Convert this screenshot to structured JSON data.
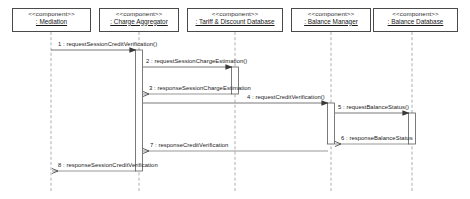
{
  "diagram": {
    "type": "uml-sequence-diagram",
    "width": 470,
    "height": 199,
    "background_color": "#ffffff",
    "line_color": "#5a5a5a",
    "text_color": "#1a1a1a"
  },
  "participants": [
    {
      "id": "mediation",
      "stereotype": "<<component>>",
      "name": ": Mediation",
      "box": {
        "x": 12,
        "y": 8,
        "w": 79,
        "h": 24
      },
      "lifeline_x": 51,
      "activation": null
    },
    {
      "id": "charge-aggregator",
      "stereotype": "<<component>>",
      "name": ": Charge Aggregator",
      "box": {
        "x": 99,
        "y": 8,
        "w": 80,
        "h": 24
      },
      "lifeline_x": 139,
      "activation": {
        "y": 50,
        "h": 121,
        "w": 7
      }
    },
    {
      "id": "tariff-discount-database",
      "stereotype": "<<component>>",
      "name": ": Tariff & Discount Database",
      "box": {
        "x": 187,
        "y": 8,
        "w": 96,
        "h": 24
      },
      "lifeline_x": 235,
      "activation": {
        "y": 67,
        "h": 27,
        "w": 7
      }
    },
    {
      "id": "balance-manager",
      "stereotype": "<<component>>",
      "name": ": Balance Manager",
      "box": {
        "x": 291,
        "y": 8,
        "w": 80,
        "h": 24
      },
      "lifeline_x": 331,
      "activation": {
        "y": 103,
        "h": 41,
        "w": 7
      }
    },
    {
      "id": "balance-database",
      "stereotype": "<<component>>",
      "name": ": Balance Database",
      "box": {
        "x": 373,
        "y": 8,
        "w": 85,
        "h": 24
      },
      "lifeline_x": 412,
      "activation": {
        "y": 113,
        "h": 31,
        "w": 7
      }
    }
  ],
  "messages": [
    {
      "number": "1",
      "label": "1 : requestSessionCreditVerification()",
      "from": "mediation",
      "to": "charge-aggregator",
      "from_x": 51,
      "to_x": 136,
      "y": 50,
      "kind": "call",
      "direction": "right",
      "label_x": 58,
      "label_y": 41
    },
    {
      "number": "2",
      "label": "2 : requestSessionChargeEstimation()",
      "from": "charge-aggregator",
      "to": "tariff-discount-database",
      "from_x": 143,
      "to_x": 232,
      "y": 67,
      "kind": "call",
      "direction": "right",
      "label_x": 146,
      "label_y": 58
    },
    {
      "number": "3",
      "label": "3 : responseSessionChargeEstimation",
      "from": "tariff-discount-database",
      "to": "charge-aggregator",
      "from_x": 232,
      "to_x": 143,
      "y": 94,
      "kind": "return",
      "direction": "left",
      "label_x": 149,
      "label_y": 85
    },
    {
      "number": "4",
      "label": "4 : requestCreditVerification()",
      "from": "charge-aggregator",
      "to": "balance-manager",
      "from_x": 143,
      "to_x": 328,
      "y": 103,
      "kind": "call",
      "direction": "right",
      "label_x": 247,
      "label_y": 94
    },
    {
      "number": "5",
      "label": "5 : requestBalanceStatus()",
      "from": "balance-manager",
      "to": "balance-database",
      "from_x": 335,
      "to_x": 409,
      "y": 113,
      "kind": "call",
      "direction": "right",
      "label_x": 338,
      "label_y": 104
    },
    {
      "number": "6",
      "label": "6 : responseBalanceStatus",
      "from": "balance-database",
      "to": "balance-manager",
      "from_x": 409,
      "to_x": 335,
      "y": 144,
      "kind": "return",
      "direction": "left",
      "label_x": 341,
      "label_y": 135
    },
    {
      "number": "7",
      "label": "7 : responseCreditVerification",
      "from": "balance-manager",
      "to": "charge-aggregator",
      "from_x": 328,
      "to_x": 143,
      "y": 151,
      "kind": "return",
      "direction": "left",
      "label_x": 150,
      "label_y": 142
    },
    {
      "number": "8",
      "label": "8 : responseSessionCreditVerification",
      "from": "charge-aggregator",
      "to": "mediation",
      "from_x": 136,
      "to_x": 52,
      "y": 171,
      "kind": "return",
      "direction": "left",
      "label_x": 58,
      "label_y": 162
    }
  ]
}
